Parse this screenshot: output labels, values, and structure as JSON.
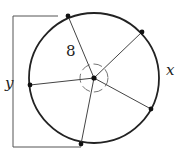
{
  "diagram": {
    "type": "circle-with-radii",
    "center": {
      "x": 94,
      "y": 78
    },
    "radius": 65,
    "points": [
      {
        "name": "top",
        "x": 68,
        "y": 16
      },
      {
        "name": "upper-right",
        "x": 142,
        "y": 32
      },
      {
        "name": "lower-right",
        "x": 151,
        "y": 109
      },
      {
        "name": "bottom",
        "x": 81,
        "y": 144
      },
      {
        "name": "left",
        "x": 30,
        "y": 85
      }
    ],
    "labels": {
      "radius": "8",
      "arc": "x",
      "bracket": "y"
    },
    "colors": {
      "stroke": "#222222",
      "background": "#ffffff"
    }
  }
}
